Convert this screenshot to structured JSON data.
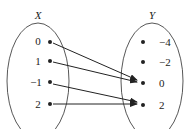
{
  "diagram": {
    "type": "mapping",
    "domain_set": {
      "label": "X",
      "elements": [
        "0",
        "1",
        "−1",
        "2"
      ]
    },
    "codomain_set": {
      "label": "Y",
      "elements": [
        "−4",
        "−2",
        "0",
        "2"
      ]
    },
    "mappings": [
      {
        "from": "0",
        "to": "0"
      },
      {
        "from": "1",
        "to": "0"
      },
      {
        "from": "−1",
        "to": "2"
      },
      {
        "from": "2",
        "to": "2"
      }
    ],
    "colors": {
      "stroke": "#222222",
      "background": "#ffffff"
    }
  }
}
